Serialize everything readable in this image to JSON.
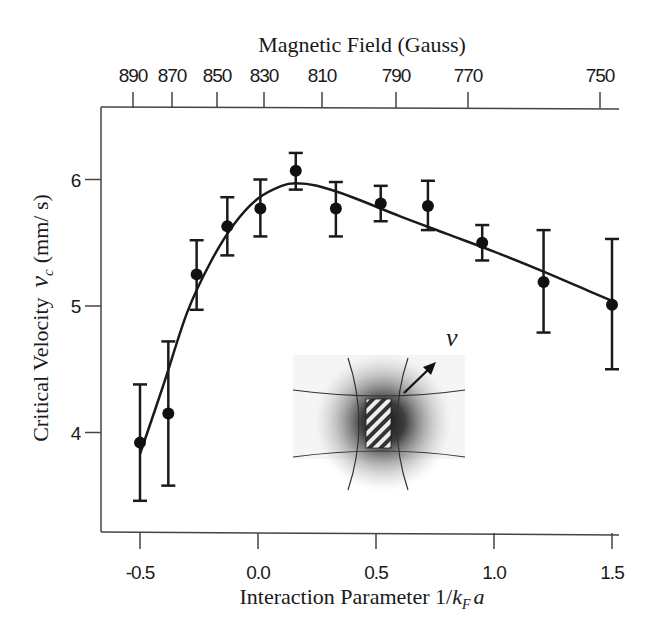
{
  "chart_data": {
    "type": "scatter",
    "title": "",
    "xlabel": "Interaction Parameter 1/k_F a",
    "xlabel_parts": {
      "prefix": "Interaction Parameter 1/",
      "k": "k",
      "sub": "F",
      "a": "a"
    },
    "ylabel": "Critical Velocity v_c (mm/s)",
    "ylabel_parts": {
      "prefix": "Critical Velocity",
      "v": "v",
      "sub": "c",
      "unit": "(mm/ s)"
    },
    "top_xlabel": "Magnetic Field (Gauss)",
    "xlim": [
      -0.67,
      1.52
    ],
    "ylim": [
      3.2,
      6.6
    ],
    "x_ticks": [
      -0.5,
      0.0,
      0.5,
      1.0,
      1.5
    ],
    "x_tick_labels": [
      "-0.5",
      "0.0",
      "0.5",
      "1.0",
      "1.5"
    ],
    "y_ticks": [
      4,
      5,
      6
    ],
    "y_tick_labels": [
      "4",
      "5",
      "6"
    ],
    "top_x_ticks": [
      -0.49,
      -0.39,
      -0.26,
      -0.1,
      0.16,
      0.53,
      1.0,
      1.5
    ],
    "top_x_tick_labels": [
      "890",
      "870",
      "850",
      "830",
      "810",
      "790",
      "770",
      "750"
    ],
    "grid": false,
    "legend": null,
    "series": [
      {
        "name": "Measured critical velocity",
        "marker": "filled-circle",
        "x": [
          -0.5,
          -0.38,
          -0.26,
          -0.13,
          0.01,
          0.16,
          0.33,
          0.52,
          0.72,
          0.95,
          1.21,
          1.5
        ],
        "y": [
          3.92,
          4.15,
          5.25,
          5.63,
          5.77,
          6.07,
          5.77,
          5.81,
          5.79,
          5.5,
          5.19,
          5.01
        ],
        "err_low": [
          3.46,
          3.58,
          4.97,
          5.4,
          5.55,
          5.92,
          5.55,
          5.67,
          5.6,
          5.36,
          4.79,
          4.5
        ],
        "err_high": [
          4.38,
          4.72,
          5.52,
          5.86,
          6.0,
          6.21,
          5.98,
          5.95,
          5.99,
          5.64,
          5.6,
          5.53
        ]
      },
      {
        "name": "Guide-to-eye curve",
        "style": "solid-line",
        "x": [
          -0.5,
          -0.4,
          -0.3,
          -0.2,
          -0.1,
          0.0,
          0.1,
          0.16,
          0.25,
          0.4,
          0.6,
          0.8,
          1.0,
          1.2,
          1.4,
          1.5
        ],
        "y": [
          3.83,
          4.38,
          4.95,
          5.35,
          5.65,
          5.85,
          5.95,
          5.97,
          5.95,
          5.86,
          5.71,
          5.57,
          5.43,
          5.28,
          5.12,
          5.04
        ]
      }
    ],
    "annotations": [
      {
        "type": "inset-diagram",
        "description": "Atom cloud with stirring laser beam (hatched rectangle) and velocity arrow",
        "label": "v"
      }
    ]
  },
  "inset": {
    "velocity_label": "v"
  }
}
